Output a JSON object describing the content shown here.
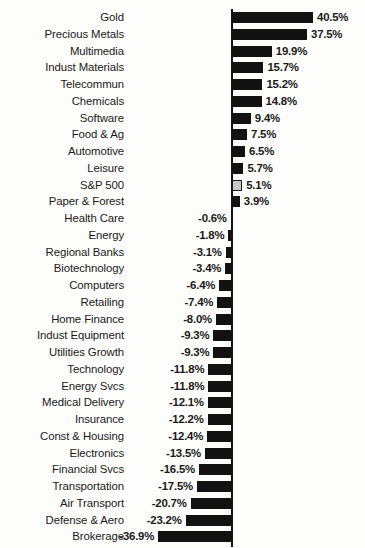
{
  "chart_data": {
    "type": "bar",
    "orientation": "horizontal",
    "title": "",
    "subtitle": "",
    "xlabel": "",
    "ylabel": "",
    "grid": false,
    "legend": null,
    "value_suffix": "%",
    "zero_line": true,
    "xlim": [
      -36.9,
      40.5
    ],
    "highlight_category": "S&P 500",
    "highlight_color": "#c8c8c8",
    "bar_color": "#121212",
    "categories": [
      "Gold",
      "Precious Metals",
      "Multimedia",
      "Indust Materials",
      "Telecommun",
      "Chemicals",
      "Software",
      "Food & Ag",
      "Automotive",
      "Leisure",
      "S&P 500",
      "Paper & Forest",
      "Health Care",
      "Energy",
      "Regional Banks",
      "Biotechnology",
      "Computers",
      "Retailing",
      "Home Finance",
      "Indust Equipment",
      "Utilities Growth",
      "Technology",
      "Energy Svcs",
      "Medical Delivery",
      "Insurance",
      "Const & Housing",
      "Electronics",
      "Financial Svcs",
      "Transportation",
      "Air Transport",
      "Defense & Aero",
      "Brokerage"
    ],
    "values": [
      40.5,
      37.5,
      19.9,
      15.7,
      15.2,
      14.8,
      9.4,
      7.5,
      6.5,
      5.7,
      5.1,
      3.9,
      -0.6,
      -1.8,
      -3.1,
      -3.4,
      -6.4,
      -7.4,
      -8.0,
      -9.3,
      -9.3,
      -11.8,
      -11.8,
      -12.1,
      -12.2,
      -12.4,
      -13.5,
      -16.5,
      -17.5,
      -20.7,
      -23.2,
      -36.9
    ],
    "value_labels": [
      "40.5%",
      "37.5%",
      "19.9%",
      "15.7%",
      "15.2%",
      "14.8%",
      "9.4%",
      "7.5%",
      "6.5%",
      "5.7%",
      "5.1%",
      "3.9%",
      "-0.6%",
      "-1.8%",
      "-3.1%",
      "-3.4%",
      "-6.4%",
      "-7.4%",
      "-8.0%",
      "-9.3%",
      "-9.3%",
      "-11.8%",
      "-11.8%",
      "-12.1%",
      "-12.2%",
      "-12.4%",
      "-13.5%",
      "-16.5%",
      "-17.5%",
      "-20.7%",
      "-23.2%",
      "-36.9%"
    ]
  },
  "layout": {
    "zero_x": 232,
    "px_per_unit": 2.0,
    "row_pitch": 16.75,
    "first_row_top": 9,
    "label_right_edge": 124,
    "bar_height": 11
  }
}
